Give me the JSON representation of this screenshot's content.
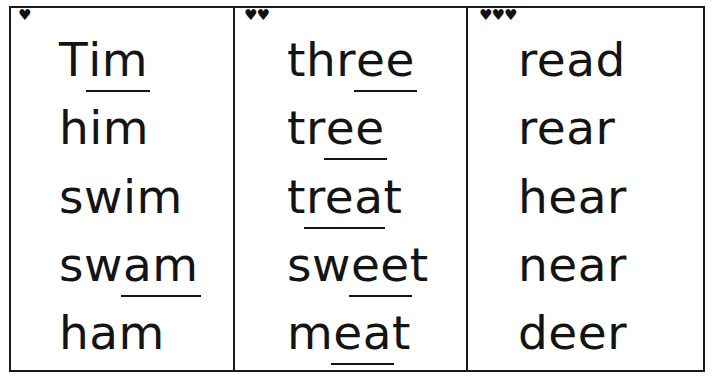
{
  "page": {
    "background_color": "#ffffff",
    "ink_color": "#141414",
    "border_color": "#1a1a1a"
  },
  "columns": [
    {
      "id": "column-1",
      "marker_icon": "heart-icon",
      "marker_count": 1,
      "marker_glyphs": "♥",
      "words": [
        {
          "text": "Tim",
          "prefix": "T",
          "underlined": "im",
          "suffix": ""
        },
        {
          "text": "him",
          "prefix": "him",
          "underlined": "",
          "suffix": ""
        },
        {
          "text": "swim",
          "prefix": "swim",
          "underlined": "",
          "suffix": ""
        },
        {
          "text": "swam",
          "prefix": "sw",
          "underlined": "am",
          "suffix": ""
        },
        {
          "text": "ham",
          "prefix": "ham",
          "underlined": "",
          "suffix": ""
        }
      ]
    },
    {
      "id": "column-2",
      "marker_icon": "heart-icon",
      "marker_count": 2,
      "marker_glyphs": "♥♥",
      "words": [
        {
          "text": "three",
          "prefix": "thr",
          "underlined": "ee",
          "suffix": ""
        },
        {
          "text": "tree",
          "prefix": "tr",
          "underlined": "ee",
          "suffix": ""
        },
        {
          "text": "treat",
          "prefix": "t",
          "underlined": "rea",
          "suffix": "t"
        },
        {
          "text": "sweet",
          "prefix": "sw",
          "underlined": "ee",
          "suffix": "t"
        },
        {
          "text": "meat",
          "prefix": "m",
          "underlined": "ea",
          "suffix": "t"
        }
      ]
    },
    {
      "id": "column-3",
      "marker_icon": "heart-icon",
      "marker_count": 3,
      "marker_glyphs": "♥♥♥",
      "words": [
        {
          "text": "read",
          "prefix": "read",
          "underlined": "",
          "suffix": ""
        },
        {
          "text": "rear",
          "prefix": "rear",
          "underlined": "",
          "suffix": ""
        },
        {
          "text": "hear",
          "prefix": "hear",
          "underlined": "",
          "suffix": ""
        },
        {
          "text": "near",
          "prefix": "near",
          "underlined": "",
          "suffix": ""
        },
        {
          "text": "deer",
          "prefix": "deer",
          "underlined": "",
          "suffix": ""
        }
      ]
    }
  ]
}
